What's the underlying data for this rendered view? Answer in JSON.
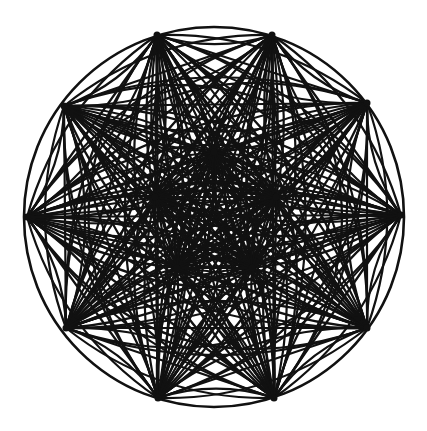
{
  "diagram": {
    "type": "circular-line-arrangement",
    "width": 427,
    "height": 431,
    "background": "#ffffff",
    "stroke_color": "#111111",
    "stroke_width": 2.2,
    "circle": {
      "cx": 214,
      "cy": 217,
      "r": 190
    },
    "boundary_points": [
      [
        157,
        35
      ],
      [
        272,
        35
      ],
      [
        367,
        103
      ],
      [
        401,
        215
      ],
      [
        367,
        328
      ],
      [
        274,
        398
      ],
      [
        158,
        398
      ],
      [
        66,
        328
      ],
      [
        27,
        217
      ],
      [
        64,
        106
      ]
    ],
    "inner_hubs": [
      [
        214,
        152
      ],
      [
        155,
        197
      ],
      [
        276,
        197
      ],
      [
        177,
        268
      ],
      [
        252,
        268
      ]
    ],
    "arc_curvatures": [
      0,
      0.18,
      -0.18,
      0.38,
      -0.38
    ],
    "adjacent_arc_bulge": 0.16
  }
}
